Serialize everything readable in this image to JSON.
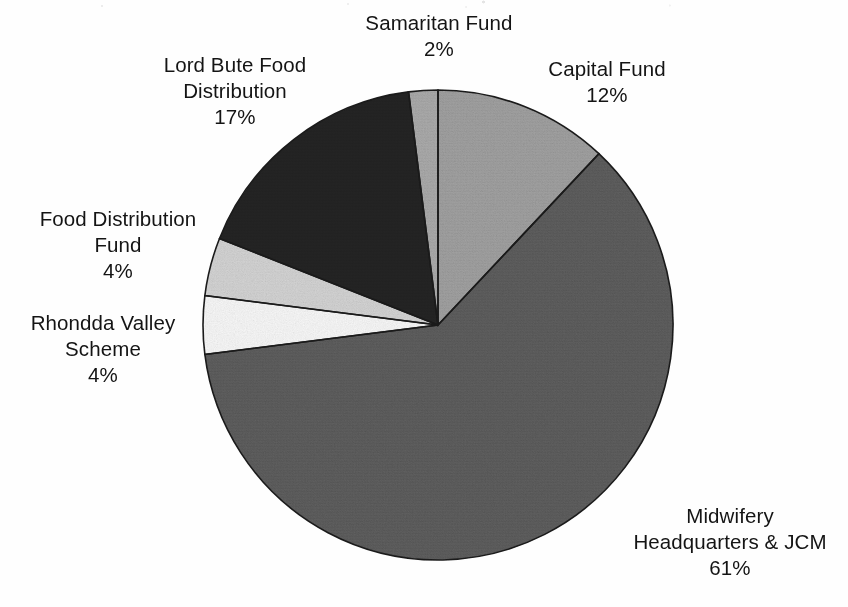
{
  "chart_data": {
    "type": "pie",
    "title": "",
    "subtitle": "",
    "xlabel": "",
    "ylabel": "",
    "legend_position": "none",
    "grid": false,
    "start_angle_deg": 0,
    "direction": "clockwise",
    "categories": [
      "Capital Fund",
      "Midwifery Headquarters & JCM",
      "Rhondda Valley Scheme",
      "Food Distribution Fund",
      "Lord Bute Food Distribution",
      "Samaritan Fund"
    ],
    "values": [
      12,
      61,
      4,
      4,
      17,
      2
    ],
    "value_unit": "%",
    "slices": [
      {
        "label": "Capital Fund",
        "label_lines": [
          "Capital Fund",
          "12%"
        ],
        "value": 12,
        "percent_text": "12%",
        "color": "#9e9e9e",
        "start_deg": 0,
        "end_deg": 43.2
      },
      {
        "label": "Midwifery Headquarters & JCM",
        "label_lines": [
          "Midwifery",
          "Headquarters & JCM",
          "61%"
        ],
        "value": 61,
        "percent_text": "61%",
        "color": "#5c5c5c",
        "start_deg": 43.2,
        "end_deg": 262.8
      },
      {
        "label": "Rhondda Valley Scheme",
        "label_lines": [
          "Rhondda Valley",
          "Scheme",
          "4%"
        ],
        "value": 4,
        "percent_text": "4%",
        "color": "#f7f7f7",
        "start_deg": 262.8,
        "end_deg": 277.2
      },
      {
        "label": "Food Distribution Fund",
        "label_lines": [
          "Food Distribution",
          "Fund",
          "4%"
        ],
        "value": 4,
        "percent_text": "4%",
        "color": "#d2d2d2",
        "start_deg": 277.2,
        "end_deg": 291.6
      },
      {
        "label": "Lord Bute Food Distribution",
        "label_lines": [
          "Lord Bute Food",
          "Distribution",
          "17%"
        ],
        "value": 17,
        "percent_text": "17%",
        "color": "#242424",
        "start_deg": 291.6,
        "end_deg": 352.8
      },
      {
        "label": "Samaritan Fund",
        "label_lines": [
          "Samaritan Fund",
          "2%"
        ],
        "value": 2,
        "percent_text": "2%",
        "color": "#a8a8a8",
        "start_deg": 352.8,
        "end_deg": 360
      }
    ],
    "colors": {
      "background": "#fefefe",
      "outline": "#1a1a1a",
      "text": "#141414"
    },
    "geometry": {
      "center_x": 438,
      "center_y": 325,
      "radius": 236
    }
  },
  "labels": {
    "samaritan_fund": {
      "line1": "Samaritan Fund",
      "line2": "2%",
      "line3": ""
    },
    "capital_fund": {
      "line1": "Capital Fund",
      "line2": "12%",
      "line3": ""
    },
    "lord_bute": {
      "line1": "Lord Bute Food",
      "line2": "Distribution",
      "line3": "17%"
    },
    "food_dist_fund": {
      "line1": "Food Distribution",
      "line2": "Fund",
      "line3": "4%"
    },
    "rhondda_valley": {
      "line1": "Rhondda Valley",
      "line2": "Scheme",
      "line3": "4%"
    },
    "midwifery": {
      "line1": "Midwifery",
      "line2": "Headquarters & JCM",
      "line3": "61%"
    }
  }
}
